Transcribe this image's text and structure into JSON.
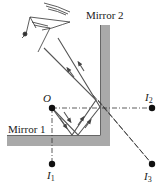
{
  "diagram": {
    "type": "optics-two-plane-mirrors",
    "labels": {
      "mirror1": "Mirror 1",
      "mirror2": "Mirror 2",
      "object": "O",
      "image1": "I",
      "image1_sub": "1",
      "image2": "I",
      "image2_sub": "2",
      "image3": "I",
      "image3_sub": "3"
    },
    "colors": {
      "mirror_fill": "#a9a9a9",
      "mirror_edge": "#555555",
      "ray": "#444444",
      "dot": "#111111",
      "text": "#1a1a1a",
      "background": "#ffffff"
    },
    "points": {
      "O": [
        52,
        108
      ],
      "I1": [
        52,
        164
      ],
      "I2": [
        152,
        108
      ],
      "I3": [
        152,
        164
      ]
    }
  }
}
